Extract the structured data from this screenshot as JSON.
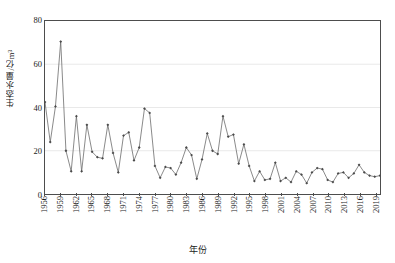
{
  "chart_data": {
    "type": "line",
    "title": "",
    "xlabel": "年份",
    "ylabel": "生态水量/亿m³",
    "ylim": [
      0,
      80
    ],
    "yticks": [
      0,
      20,
      40,
      60,
      80
    ],
    "xlim": [
      1956,
      2020
    ],
    "xticks": [
      1956,
      1959,
      1962,
      1965,
      1968,
      1971,
      1974,
      1977,
      1980,
      1983,
      1986,
      1989,
      1992,
      1995,
      1998,
      2001,
      2004,
      2007,
      2010,
      2013,
      2016,
      2019
    ],
    "grid": "horizontal",
    "legend": "none",
    "marker": "diamond",
    "line_color": "#6b6b6b",
    "marker_color": "#4a4a4a",
    "x": [
      1956,
      1957,
      1958,
      1959,
      1960,
      1961,
      1962,
      1963,
      1964,
      1965,
      1966,
      1967,
      1968,
      1969,
      1970,
      1971,
      1972,
      1973,
      1974,
      1975,
      1976,
      1977,
      1978,
      1979,
      1980,
      1981,
      1982,
      1983,
      1984,
      1985,
      1986,
      1987,
      1988,
      1989,
      1990,
      1991,
      1992,
      1993,
      1994,
      1995,
      1996,
      1997,
      1998,
      1999,
      2000,
      2001,
      2002,
      2003,
      2004,
      2005,
      2006,
      2007,
      2008,
      2009,
      2010,
      2011,
      2012,
      2013,
      2014,
      2015,
      2016,
      2017,
      2018,
      2019,
      2020
    ],
    "values": [
      42.5,
      24.0,
      40.5,
      70.5,
      20.0,
      10.5,
      36.0,
      10.5,
      32.0,
      19.5,
      17.0,
      16.5,
      32.0,
      19.0,
      10.0,
      27.0,
      28.5,
      15.5,
      21.5,
      39.5,
      37.5,
      13.0,
      7.5,
      12.5,
      12.0,
      9.0,
      14.5,
      21.5,
      18.0,
      7.0,
      16.0,
      28.0,
      20.0,
      18.5,
      36.0,
      26.5,
      27.5,
      14.0,
      23.0,
      13.0,
      6.0,
      10.5,
      6.5,
      7.0,
      14.5,
      6.0,
      7.5,
      5.5,
      10.5,
      9.0,
      5.0,
      10.0,
      12.0,
      11.5,
      6.5,
      5.5,
      9.5,
      10.0,
      7.5,
      9.5,
      13.5,
      10.0,
      8.5,
      8.0,
      8.5
    ]
  }
}
